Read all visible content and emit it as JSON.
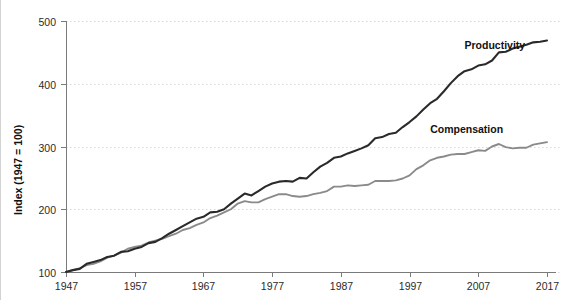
{
  "chart_data": {
    "type": "line",
    "title": "",
    "xlabel": "",
    "ylabel": "Index (1947 = 100)",
    "xlim": [
      1947,
      2017
    ],
    "ylim": [
      100,
      500
    ],
    "grid": true,
    "grid_style": "dotted-horizontal",
    "legend_position": "inline-right",
    "x_ticks": [
      1947,
      1957,
      1967,
      1977,
      1987,
      1997,
      2007,
      2017
    ],
    "y_ticks": [
      100,
      200,
      300,
      400,
      500
    ],
    "colors": {
      "productivity": "#2a2a2a",
      "compensation": "#8a8a8a",
      "grid": "#d9d9d9",
      "axis": "#7a7a7a",
      "text": "#2b2b2b",
      "background": "#ffffff"
    },
    "series": [
      {
        "name": "Productivity",
        "color": "#2a2a2a",
        "label_x": 2005,
        "label_y": 455,
        "x": [
          1947,
          1948,
          1949,
          1950,
          1951,
          1952,
          1953,
          1954,
          1955,
          1956,
          1957,
          1958,
          1959,
          1960,
          1961,
          1962,
          1963,
          1964,
          1965,
          1966,
          1967,
          1968,
          1969,
          1970,
          1971,
          1972,
          1973,
          1974,
          1975,
          1976,
          1977,
          1978,
          1979,
          1980,
          1981,
          1982,
          1983,
          1984,
          1985,
          1986,
          1987,
          1988,
          1989,
          1990,
          1991,
          1992,
          1993,
          1994,
          1995,
          1996,
          1997,
          1998,
          1999,
          2000,
          2001,
          2002,
          2003,
          2004,
          2005,
          2006,
          2007,
          2008,
          2009,
          2010,
          2011,
          2012,
          2013,
          2014,
          2015,
          2016,
          2017
        ],
        "values": [
          100,
          103,
          105,
          113,
          116,
          119,
          124,
          126,
          132,
          133,
          137,
          140,
          146,
          148,
          154,
          161,
          167,
          173,
          179,
          185,
          188,
          195,
          196,
          200,
          209,
          217,
          225,
          222,
          229,
          236,
          241,
          244,
          245,
          244,
          250,
          249,
          259,
          268,
          274,
          282,
          284,
          289,
          293,
          297,
          302,
          313,
          315,
          320,
          322,
          331,
          339,
          348,
          359,
          369,
          376,
          388,
          401,
          412,
          420,
          423,
          429,
          431,
          437,
          450,
          451,
          456,
          459,
          462,
          466,
          467,
          469
        ]
      },
      {
        "name": "Compensation",
        "color": "#8a8a8a",
        "label_x": 2000,
        "label_y": 322,
        "x": [
          1947,
          1948,
          1949,
          1950,
          1951,
          1952,
          1953,
          1954,
          1955,
          1956,
          1957,
          1958,
          1959,
          1960,
          1961,
          1962,
          1963,
          1964,
          1965,
          1966,
          1967,
          1968,
          1969,
          1970,
          1971,
          1972,
          1973,
          1974,
          1975,
          1976,
          1977,
          1978,
          1979,
          1980,
          1981,
          1982,
          1983,
          1984,
          1985,
          1986,
          1987,
          1988,
          1989,
          1990,
          1991,
          1992,
          1993,
          1994,
          1995,
          1996,
          1997,
          1998,
          1999,
          2000,
          2001,
          2002,
          2003,
          2004,
          2005,
          2006,
          2007,
          2008,
          2009,
          2010,
          2011,
          2012,
          2013,
          2014,
          2015,
          2016,
          2017
        ],
        "values": [
          100,
          103,
          106,
          111,
          113,
          117,
          123,
          126,
          131,
          137,
          140,
          142,
          147,
          150,
          153,
          157,
          161,
          167,
          170,
          175,
          179,
          186,
          190,
          195,
          200,
          209,
          213,
          211,
          211,
          216,
          220,
          224,
          224,
          221,
          220,
          221,
          224,
          226,
          229,
          236,
          236,
          238,
          237,
          238,
          239,
          245,
          245,
          245,
          246,
          249,
          254,
          264,
          270,
          278,
          282,
          284,
          287,
          288,
          288,
          291,
          294,
          293,
          300,
          304,
          299,
          297,
          298,
          298,
          303,
          305,
          307
        ]
      }
    ],
    "annotations": [
      {
        "text": "Productivity",
        "series": "productivity"
      },
      {
        "text": "Compensation",
        "series": "compensation"
      }
    ]
  },
  "labels": {
    "y_axis_title": "Index (1947 = 100)",
    "productivity": "Productivity",
    "compensation": "Compensation"
  }
}
